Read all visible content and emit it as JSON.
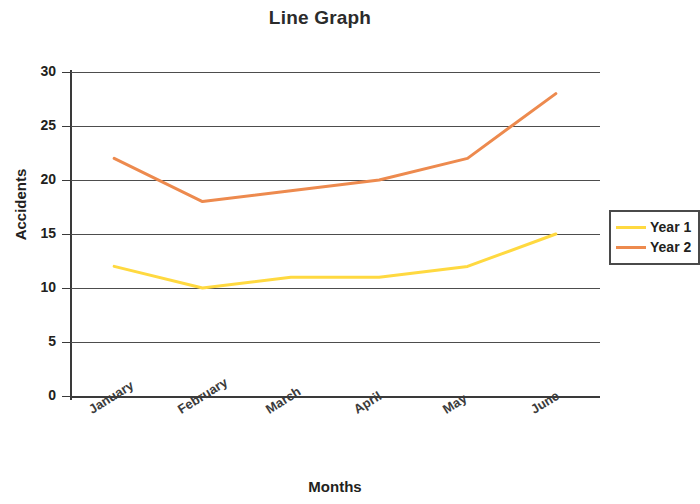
{
  "chart_data": {
    "type": "line",
    "title": "Line Graph",
    "xlabel": "Months",
    "ylabel": "Accidents",
    "categories": [
      "January",
      "February",
      "March",
      "April",
      "May",
      "June"
    ],
    "series": [
      {
        "name": "Year 1",
        "color": "#FFD940",
        "values": [
          12,
          10,
          11,
          11,
          12,
          15
        ]
      },
      {
        "name": "Year 2",
        "color": "#ED8A4E",
        "values": [
          22,
          18,
          19,
          20,
          22,
          28
        ]
      }
    ],
    "ylim": [
      0,
      30
    ],
    "y_ticks": [
      0,
      5,
      10,
      15,
      20,
      25,
      30
    ],
    "grid": "horizontal",
    "legend_position": "right"
  }
}
